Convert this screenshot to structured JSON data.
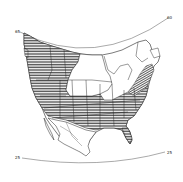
{
  "map": {
    "title": "",
    "type": "range-map",
    "region": "North America",
    "background": "#ffffff",
    "ink": "#1a1a1a",
    "hatch_color": "#333333",
    "latitude_labels": [
      {
        "id": "top-left",
        "text": "65"
      },
      {
        "id": "top-right",
        "text": "60"
      },
      {
        "id": "bottom-left",
        "text": "25"
      },
      {
        "id": "bottom-right",
        "text": "25"
      }
    ],
    "legend": [
      {
        "pattern": "horizontal-hatch",
        "label": ""
      }
    ]
  }
}
